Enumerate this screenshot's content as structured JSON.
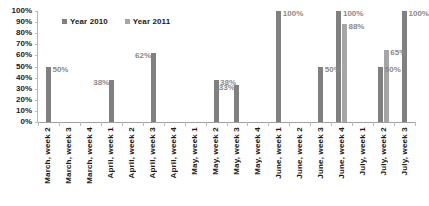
{
  "chart_data": {
    "type": "bar",
    "title": "",
    "xlabel": "",
    "ylabel": "",
    "ylim": [
      0,
      100
    ],
    "grid": true,
    "legend_position": "top-left",
    "ytick_labels": [
      "100%",
      "90%",
      "80%",
      "70%",
      "60%",
      "50%",
      "40%",
      "30%",
      "20%",
      "10%",
      "0%"
    ],
    "ytick_values": [
      100,
      90,
      80,
      70,
      60,
      50,
      40,
      30,
      20,
      10,
      0
    ],
    "categories": [
      "March, week 2",
      "March, week 3",
      "March, week 4",
      "April, week 1",
      "April, week 2",
      "April, week 3",
      "April, week 4",
      "May, week 1",
      "May, week 2",
      "May, week 3",
      "May, week 4",
      "June, week 1",
      "June, week 2",
      "June, week 3",
      "June, week 4",
      "July, week 1",
      "July, week 2",
      "July, week 3"
    ],
    "series": [
      {
        "name": "Year 2010",
        "color": "#808080",
        "values": [
          50,
          null,
          null,
          38,
          null,
          62,
          null,
          null,
          38,
          33,
          null,
          100,
          null,
          50,
          100,
          null,
          50,
          100
        ]
      },
      {
        "name": "Year 2011",
        "color": "#a6a6a6",
        "values": [
          null,
          null,
          null,
          null,
          null,
          null,
          null,
          null,
          null,
          null,
          null,
          null,
          null,
          null,
          88,
          null,
          65,
          null
        ]
      }
    ],
    "data_labels": [
      {
        "text": "50%",
        "series": 0,
        "category_index": 0
      },
      {
        "text": "38%",
        "series": 0,
        "category_index": 3
      },
      {
        "text": "62%",
        "series": 0,
        "category_index": 5
      },
      {
        "text": "38%",
        "series": 0,
        "category_index": 8
      },
      {
        "text": "33%",
        "series": 0,
        "category_index": 9
      },
      {
        "text": "100%",
        "series": 0,
        "category_index": 11
      },
      {
        "text": "50%",
        "series": 0,
        "category_index": 13
      },
      {
        "text": "100%",
        "series": 0,
        "category_index": 14
      },
      {
        "text": "88%",
        "series": 1,
        "category_index": 14
      },
      {
        "text": "50%",
        "series": 0,
        "category_index": 16
      },
      {
        "text": "65%",
        "series": 1,
        "category_index": 16
      },
      {
        "text": "100%",
        "series": 0,
        "category_index": 17
      }
    ]
  },
  "legend": {
    "items": [
      {
        "label": "Year 2010",
        "color": "#808080"
      },
      {
        "label": "Year 2011",
        "color": "#a6a6a6"
      }
    ]
  },
  "colors": {
    "series_2010": "#808080",
    "series_2011": "#a6a6a6",
    "axis": "#b4b4b4",
    "gridline": "#bdbdbd",
    "label_text": "#8a8a8a",
    "tick_text": "#1a1a1a",
    "background": "#ffffff"
  }
}
